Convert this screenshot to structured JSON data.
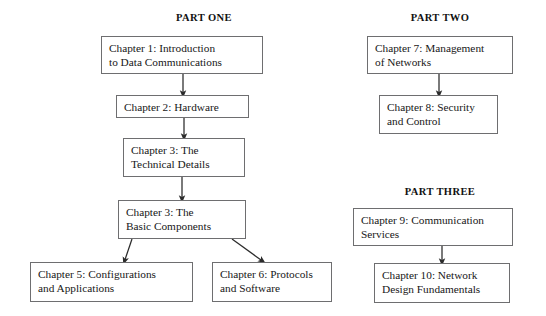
{
  "diagram": {
    "background_color": "#ffffff",
    "box_border_color": "#6e6e70",
    "arrow_color": "#2b2b2b",
    "text_color": "#171717"
  },
  "headings": [
    {
      "id": "part-one",
      "label": "PART ONE",
      "x": 204,
      "y": 12
    },
    {
      "id": "part-two",
      "label": "PART TWO",
      "x": 440,
      "y": 12
    },
    {
      "id": "part-three",
      "label": "PART THREE",
      "x": 440,
      "y": 186
    }
  ],
  "nodes": [
    {
      "id": "chapter-1",
      "lines": [
        "Chapter 1: Introduction",
        "to Data Communications"
      ],
      "x": 101,
      "y": 36,
      "w": 162,
      "h": 38
    },
    {
      "id": "chapter-2",
      "lines": [
        "Chapter 2: Hardware"
      ],
      "x": 116,
      "y": 95,
      "w": 133,
      "h": 23
    },
    {
      "id": "chapter-3-technical",
      "lines": [
        "Chapter 3: The",
        "Technical Details"
      ],
      "x": 123,
      "y": 138,
      "w": 122,
      "h": 39
    },
    {
      "id": "chapter-3-basic",
      "lines": [
        "Chapter 3: The",
        "Basic Components"
      ],
      "x": 118,
      "y": 200,
      "w": 128,
      "h": 39
    },
    {
      "id": "chapter-5",
      "lines": [
        "Chapter 5: Configurations",
        "and Applications"
      ],
      "x": 30,
      "y": 262,
      "w": 163,
      "h": 40
    },
    {
      "id": "chapter-6",
      "lines": [
        "Chapter 6: Protocols",
        "and Software"
      ],
      "x": 212,
      "y": 262,
      "w": 120,
      "h": 40
    },
    {
      "id": "chapter-7",
      "lines": [
        "Chapter 7: Management",
        "of Networks"
      ],
      "x": 367,
      "y": 36,
      "w": 146,
      "h": 38
    },
    {
      "id": "chapter-8",
      "lines": [
        "Chapter 8: Security",
        "and Control"
      ],
      "x": 379,
      "y": 95,
      "w": 119,
      "h": 39
    },
    {
      "id": "chapter-9",
      "lines": [
        "Chapter 9: Communication",
        "Services"
      ],
      "x": 353,
      "y": 208,
      "w": 160,
      "h": 38
    },
    {
      "id": "chapter-10",
      "lines": [
        "Chapter 10: Network",
        "Design Fundamentals"
      ],
      "x": 374,
      "y": 263,
      "w": 136,
      "h": 40
    }
  ],
  "connectors": [
    {
      "id": "c1-to-c2",
      "from": "chapter-1",
      "to": "chapter-2",
      "kind": "vertical"
    },
    {
      "id": "c2-to-c3tech",
      "from": "chapter-2",
      "to": "chapter-3-technical",
      "kind": "vertical"
    },
    {
      "id": "c3tech-to-c3b",
      "from": "chapter-3-technical",
      "to": "chapter-3-basic",
      "kind": "vertical"
    },
    {
      "id": "c3b-to-c5",
      "from": "chapter-3-basic",
      "to": "chapter-5",
      "kind": "diagonal-left"
    },
    {
      "id": "c3b-to-c6",
      "from": "chapter-3-basic",
      "to": "chapter-6",
      "kind": "diagonal-right"
    },
    {
      "id": "c7-to-c8",
      "from": "chapter-7",
      "to": "chapter-8",
      "kind": "vertical"
    },
    {
      "id": "c9-to-c10",
      "from": "chapter-9",
      "to": "chapter-10",
      "kind": "vertical"
    }
  ]
}
